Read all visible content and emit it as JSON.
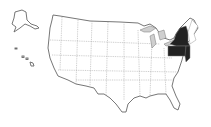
{
  "map": {
    "title": "United States",
    "highlighted_states": [
      "New York",
      "Pennsylvania",
      "New Jersey"
    ],
    "region": "Mid-Atlantic",
    "highlight_color": "#222222",
    "base_color": "#ffffff",
    "lake_color": "#cfcfcf",
    "insets": [
      "Alaska",
      "Hawaii"
    ]
  }
}
